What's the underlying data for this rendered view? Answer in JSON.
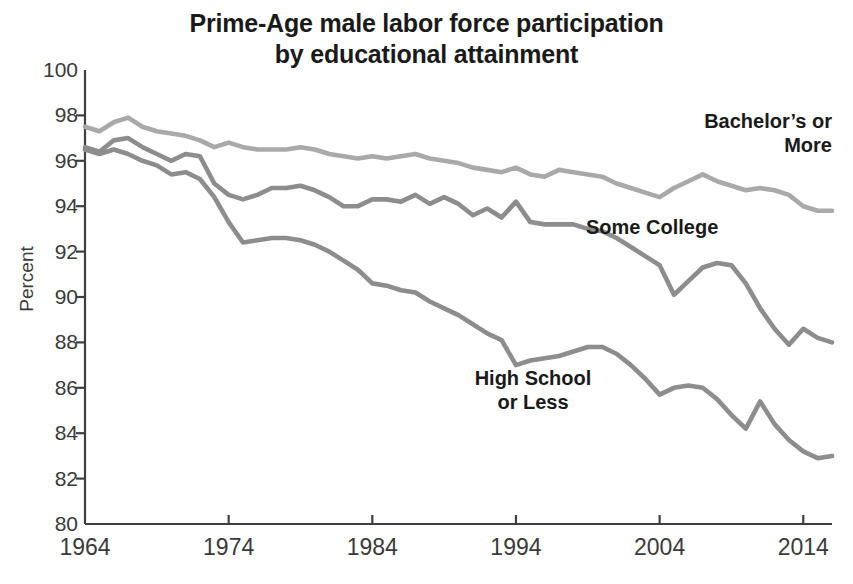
{
  "chart_data": {
    "type": "line",
    "title": "Prime-Age male labor force participation\nby educational attainment",
    "xlabel": "",
    "ylabel": "Percent",
    "xlim": [
      1964,
      2016
    ],
    "ylim": [
      80,
      100
    ],
    "ytick_step": 2,
    "yticks": [
      100,
      98,
      96,
      94,
      92,
      90,
      88,
      86,
      84,
      82,
      80
    ],
    "xticks": [
      1964,
      1974,
      1984,
      1994,
      2004,
      2014
    ],
    "grid": false,
    "legend_position": "inline-annotations",
    "x": [
      1964,
      1965,
      1966,
      1967,
      1968,
      1969,
      1970,
      1971,
      1972,
      1973,
      1974,
      1975,
      1976,
      1977,
      1978,
      1979,
      1980,
      1981,
      1982,
      1983,
      1984,
      1985,
      1986,
      1987,
      1988,
      1989,
      1990,
      1991,
      1992,
      1993,
      1994,
      1995,
      1996,
      1997,
      1998,
      1999,
      2000,
      2001,
      2002,
      2003,
      2004,
      2005,
      2006,
      2007,
      2008,
      2009,
      2010,
      2011,
      2012,
      2013,
      2014,
      2015,
      2016
    ],
    "series": [
      {
        "name": "Bachelor's or More",
        "color": "#a9a9a9",
        "values": [
          97.5,
          97.3,
          97.7,
          97.9,
          97.5,
          97.3,
          97.2,
          97.1,
          96.9,
          96.6,
          96.8,
          96.6,
          96.5,
          96.5,
          96.5,
          96.6,
          96.5,
          96.3,
          96.2,
          96.1,
          96.2,
          96.1,
          96.2,
          96.3,
          96.1,
          96.0,
          95.9,
          95.7,
          95.6,
          95.5,
          95.7,
          95.4,
          95.3,
          95.6,
          95.5,
          95.4,
          95.3,
          95.0,
          94.8,
          94.6,
          94.4,
          94.8,
          95.1,
          95.4,
          95.1,
          94.9,
          94.7,
          94.8,
          94.7,
          94.5,
          94.0,
          93.8,
          93.8
        ]
      },
      {
        "name": "Some College",
        "color": "#8d8d8d",
        "values": [
          96.6,
          96.4,
          96.9,
          97.0,
          96.6,
          96.3,
          96.0,
          96.3,
          96.2,
          95.0,
          94.5,
          94.3,
          94.5,
          94.8,
          94.8,
          94.9,
          94.7,
          94.4,
          94.0,
          94.0,
          94.3,
          94.3,
          94.2,
          94.5,
          94.1,
          94.4,
          94.1,
          93.6,
          93.9,
          93.5,
          94.2,
          93.3,
          93.2,
          93.2,
          93.2,
          93.0,
          92.9,
          92.6,
          92.2,
          91.8,
          91.4,
          90.1,
          90.7,
          91.3,
          91.5,
          91.4,
          90.6,
          89.5,
          88.6,
          87.9,
          88.6,
          88.2,
          88.0
        ]
      },
      {
        "name": "High School or Less",
        "color": "#8d8d8d",
        "values": [
          96.5,
          96.3,
          96.5,
          96.3,
          96.0,
          95.8,
          95.4,
          95.5,
          95.2,
          94.4,
          93.3,
          92.4,
          92.5,
          92.6,
          92.6,
          92.5,
          92.3,
          92.0,
          91.6,
          91.2,
          90.6,
          90.5,
          90.3,
          90.2,
          89.8,
          89.5,
          89.2,
          88.8,
          88.4,
          88.1,
          87.0,
          87.2,
          87.3,
          87.4,
          87.6,
          87.8,
          87.8,
          87.5,
          87.0,
          86.4,
          85.7,
          86.0,
          86.1,
          86.0,
          85.5,
          84.8,
          84.2,
          85.4,
          84.4,
          83.7,
          83.2,
          82.9,
          83.0
        ]
      }
    ]
  },
  "axes": {
    "y_title": "Percent",
    "y_tick_labels": [
      "100",
      "98",
      "96",
      "94",
      "92",
      "90",
      "88",
      "86",
      "84",
      "82",
      "80"
    ],
    "x_tick_labels": [
      "1964",
      "1974",
      "1984",
      "1994",
      "2004",
      "2014"
    ]
  },
  "annotations": {
    "bachelors": "Bachelor’s or\nMore",
    "some_college": "Some College",
    "high_school": "High School\nor Less"
  },
  "colors": {
    "axis": "#3f3f3f",
    "text": "#231f20",
    "bachelors_line": "#a9a9a9",
    "some_college_line": "#8d8d8d",
    "high_school_line": "#8d8d8d",
    "background": "#ffffff"
  }
}
